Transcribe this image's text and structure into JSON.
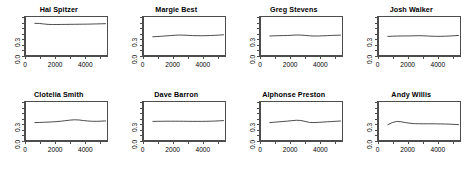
{
  "figure": {
    "type": "small-multiples",
    "rows": 2,
    "columns": 4,
    "line_color": "#000000",
    "axis_color": "#4d4d4d",
    "background": "#ffffff"
  },
  "axes": {
    "x": {
      "min": 0,
      "max": 5500,
      "tick_values": [
        0,
        1000,
        2000,
        3000,
        4000,
        5000
      ],
      "labeled_ticks": [
        0,
        2000,
        4000
      ],
      "tick_labels": [
        "0",
        "2000",
        "4000"
      ],
      "title": ""
    },
    "y": {
      "min": 0.0,
      "max": 0.72,
      "tick_values": [
        0.0,
        0.1,
        0.2,
        0.3,
        0.4,
        0.5,
        0.6,
        0.7
      ],
      "labeled_ticks": [
        0.0,
        0.3
      ],
      "tick_labels": [
        "0.0",
        "0.3"
      ],
      "title": ""
    }
  },
  "chart_data": {
    "type": "line",
    "title": "",
    "subtitle": "",
    "xlabel": "",
    "ylabel": "",
    "xlim": [
      0,
      5500
    ],
    "ylim": [
      0.0,
      0.72
    ],
    "grid": false,
    "legend": "none",
    "panel_layout": [
      2,
      4
    ],
    "x": [
      600,
      900,
      1200,
      1500,
      1800,
      2100,
      2400,
      2700,
      3000,
      3300,
      3600,
      3900,
      4200,
      4500,
      4800,
      5100,
      5400
    ],
    "panels": [
      {
        "title": "Hal Spitzer",
        "values": [
          0.6,
          0.598,
          0.588,
          0.58,
          0.578,
          0.578,
          0.579,
          0.58,
          0.581,
          0.582,
          0.583,
          0.584,
          0.585,
          0.587,
          0.589,
          0.591,
          0.594
        ]
      },
      {
        "title": "Margie Best",
        "values": [
          0.345,
          0.35,
          0.356,
          0.362,
          0.368,
          0.374,
          0.378,
          0.376,
          0.372,
          0.368,
          0.366,
          0.365,
          0.366,
          0.369,
          0.373,
          0.378,
          0.383
        ]
      },
      {
        "title": "Greg Stevens",
        "values": [
          0.36,
          0.363,
          0.366,
          0.368,
          0.37,
          0.374,
          0.379,
          0.377,
          0.371,
          0.364,
          0.36,
          0.36,
          0.363,
          0.367,
          0.371,
          0.374,
          0.376
        ]
      },
      {
        "title": "Josh Walker",
        "values": [
          0.352,
          0.356,
          0.359,
          0.36,
          0.361,
          0.362,
          0.364,
          0.366,
          0.364,
          0.36,
          0.356,
          0.354,
          0.354,
          0.356,
          0.36,
          0.365,
          0.37
        ]
      },
      {
        "title": "Clotelia Smith",
        "values": [
          0.33,
          0.333,
          0.336,
          0.339,
          0.343,
          0.349,
          0.357,
          0.367,
          0.377,
          0.383,
          0.379,
          0.369,
          0.36,
          0.355,
          0.354,
          0.357,
          0.362
        ]
      },
      {
        "title": "Dave Barron",
        "values": [
          0.352,
          0.354,
          0.355,
          0.356,
          0.356,
          0.356,
          0.356,
          0.355,
          0.354,
          0.353,
          0.353,
          0.353,
          0.354,
          0.356,
          0.359,
          0.363,
          0.368
        ]
      },
      {
        "title": "Alphonse Preston",
        "values": [
          0.33,
          0.337,
          0.344,
          0.351,
          0.358,
          0.366,
          0.374,
          0.37,
          0.352,
          0.333,
          0.33,
          0.334,
          0.34,
          0.345,
          0.35,
          0.355,
          0.36
        ]
      },
      {
        "title": "Andy Willis",
        "values": [
          0.29,
          0.33,
          0.352,
          0.345,
          0.33,
          0.318,
          0.31,
          0.308,
          0.307,
          0.307,
          0.307,
          0.306,
          0.305,
          0.303,
          0.3,
          0.296,
          0.291
        ]
      }
    ]
  }
}
